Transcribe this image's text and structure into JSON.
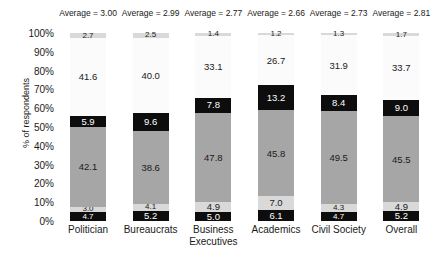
{
  "chart_data": {
    "type": "bar",
    "subtype": "stacked-bar-100-percent",
    "title": "",
    "xlabel": "",
    "ylabel": "% of respondents",
    "ylim": [
      0,
      100
    ],
    "ytick_labels": [
      "100%",
      "90%",
      "80%",
      "70%",
      "60%",
      "50%",
      "40%",
      "30%",
      "20%",
      "10%",
      "0%"
    ],
    "ytick_values": [
      100,
      90,
      80,
      70,
      60,
      50,
      40,
      30,
      20,
      10,
      0
    ],
    "grid": false,
    "legend": "none",
    "categories": [
      "Politician",
      "Bureaucrats",
      "Business Executives",
      "Academics",
      "Civil Society",
      "Overall"
    ],
    "category_lines": [
      [
        "Politician"
      ],
      [
        "Bureaucrats"
      ],
      [
        "Business",
        "Executives"
      ],
      [
        "Academics"
      ],
      [
        "Civil Society"
      ],
      [
        "Overall"
      ]
    ],
    "stack_order": "bottom-to-top",
    "series": [
      {
        "name": "segment-1",
        "color": "#0d0d0d",
        "values": [
          4.7,
          5.2,
          5.0,
          6.1,
          4.7,
          5.2
        ]
      },
      {
        "name": "segment-2",
        "color": "#d9d9d9",
        "values": [
          3.0,
          4.1,
          4.9,
          7.0,
          4.3,
          4.9
        ]
      },
      {
        "name": "segment-3",
        "color": "#a6a6a6",
        "values": [
          42.1,
          38.6,
          47.8,
          45.8,
          49.5,
          45.5
        ]
      },
      {
        "name": "segment-4",
        "color": "#0d0d0d",
        "values": [
          5.9,
          9.6,
          7.8,
          13.2,
          8.4,
          9.0
        ]
      },
      {
        "name": "segment-5",
        "color": "#fbfbfb",
        "values": [
          41.6,
          40.0,
          33.1,
          26.7,
          31.9,
          33.7
        ]
      },
      {
        "name": "segment-6",
        "color": "#d9d9d9",
        "values": [
          2.7,
          2.5,
          1.4,
          1.2,
          1.3,
          1.7
        ]
      }
    ],
    "annotations": {
      "averages": [
        "Average = 3.00",
        "Average = 2.99",
        "Average = 2.77",
        "Average = 2.66",
        "Average = 2.73",
        "Average = 2.81"
      ],
      "average_values": [
        3.0,
        2.99,
        2.77,
        2.66,
        2.73,
        2.81
      ],
      "average_prefix": "Average = "
    }
  }
}
